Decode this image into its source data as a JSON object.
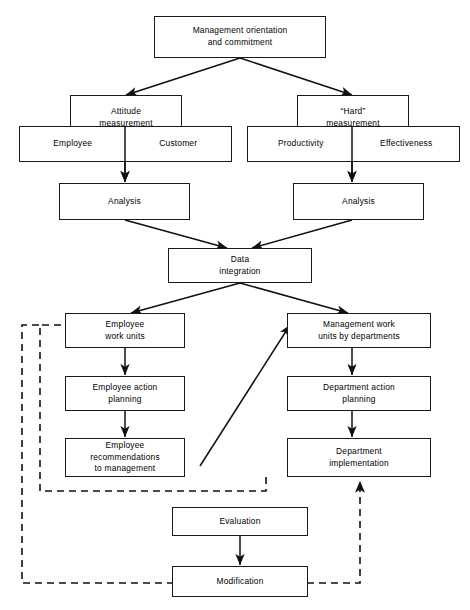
{
  "diagram": {
    "line_color": "#111111",
    "box_fill": "#ffffff",
    "nodes": {
      "management_orientation": "Management orientation\nand commitment",
      "attitude_measurement": "Attitude\nmeasurement",
      "hard_measurement": "“Hard”\nmeasurement",
      "employee": "Employee",
      "customer": "Customer",
      "productivity": "Productivity",
      "effectiveness": "Effectiveness",
      "analysis_left": "Analysis",
      "analysis_right": "Analysis",
      "data_integration": "Data\nintegration",
      "employee_work_units": "Employee\nwork units",
      "management_work_units": "Management work\nunits by departments",
      "employee_action_planning": "Employee action\nplanning",
      "department_action_planning": "Department action\nplanning",
      "employee_recommendations": "Employee\nrecommendations\nto management",
      "department_implementation": "Department\nimplementation",
      "evaluation": "Evaluation",
      "modification": "Modification"
    },
    "edges": [
      {
        "from": "management_orientation",
        "to": "attitude_measurement",
        "style": "solid"
      },
      {
        "from": "management_orientation",
        "to": "hard_measurement",
        "style": "solid"
      },
      {
        "from": "attitude_measurement",
        "to": "analysis_left",
        "style": "solid"
      },
      {
        "from": "hard_measurement",
        "to": "analysis_right",
        "style": "solid"
      },
      {
        "from": "analysis_left",
        "to": "data_integration",
        "style": "solid"
      },
      {
        "from": "analysis_right",
        "to": "data_integration",
        "style": "solid"
      },
      {
        "from": "data_integration",
        "to": "employee_work_units",
        "style": "solid"
      },
      {
        "from": "data_integration",
        "to": "management_work_units",
        "style": "solid"
      },
      {
        "from": "employee_work_units",
        "to": "employee_action_planning",
        "style": "solid"
      },
      {
        "from": "employee_action_planning",
        "to": "employee_recommendations",
        "style": "solid"
      },
      {
        "from": "employee_recommendations",
        "to": "management_work_units",
        "style": "solid"
      },
      {
        "from": "management_work_units",
        "to": "department_action_planning",
        "style": "solid"
      },
      {
        "from": "department_action_planning",
        "to": "department_implementation",
        "style": "solid"
      },
      {
        "from": "evaluation",
        "to": "modification",
        "style": "solid"
      },
      {
        "from": "department_implementation",
        "to": "employee_work_units",
        "style": "dashed"
      },
      {
        "from": "modification",
        "to": "employee_work_units",
        "style": "dashed"
      },
      {
        "from": "modification",
        "to": "department_implementation",
        "style": "dashed"
      }
    ]
  }
}
